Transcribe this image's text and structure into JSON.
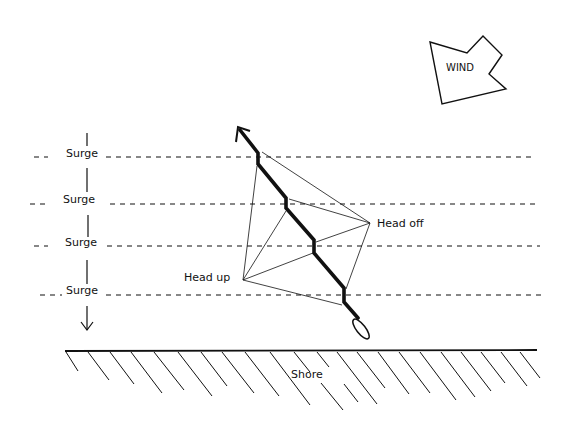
{
  "diagram": {
    "type": "sailing-tactics",
    "wind": {
      "label": "WIND"
    },
    "surge": {
      "labels": [
        "Surge",
        "Surge",
        "Surge",
        "Surge"
      ],
      "direction": "toward shore"
    },
    "tack_points": {
      "head_up": "Head up",
      "head_off": "Head off"
    },
    "shore": {
      "label": "Shore"
    }
  },
  "colors": {
    "ink": "#111111",
    "background": "#ffffff"
  }
}
